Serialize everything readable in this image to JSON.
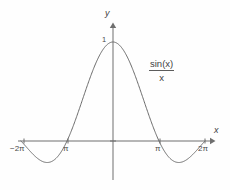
{
  "figure": {
    "title": "",
    "background_color": "#fefefe",
    "line_color": "#6a6a6a",
    "text_color": "#4a4a4a",
    "width": 230,
    "height": 190
  },
  "axes": {
    "y_axis_label": "y",
    "x_axis_label": "x",
    "y_tick_label": "1",
    "x_tick_labels": [
      "−2π",
      "π",
      "π",
      "2π"
    ],
    "x_tick_left_outer": "−2π",
    "x_tick_left_inner": "π",
    "x_tick_right_inner": "π",
    "x_tick_right_outer": "2π"
  },
  "annotation": {
    "numerator": "sin(x)",
    "denominator": "x",
    "full_text": "sin(x)/x"
  },
  "chart_data": {
    "type": "line",
    "title": "",
    "xlabel": "x",
    "ylabel": "y",
    "function": "sin(x)/x",
    "legend": [
      "sin(x)/x"
    ],
    "legend_position": "inline-right",
    "grid": false,
    "xlim": [
      -6.8,
      7.4
    ],
    "ylim": [
      -0.42,
      1.22
    ],
    "xticks": [
      -6.283185,
      -3.141593,
      3.141593,
      6.283185
    ],
    "xtick_labels": [
      "−2π",
      "π",
      "π",
      "2π"
    ],
    "yticks": [
      1
    ],
    "ytick_labels": [
      "1"
    ],
    "annotations": [
      {
        "text": "sin(x)/x",
        "x": 4.4,
        "y": 0.62
      }
    ],
    "key_points": {
      "maximum": {
        "x": 0,
        "y": 1
      },
      "zeros": [
        -6.283185,
        -3.141593,
        3.141593,
        6.283185
      ],
      "minima": [
        {
          "x": -4.493409,
          "y": -0.217234
        },
        {
          "x": 4.493409,
          "y": -0.217234
        }
      ]
    },
    "x": [
      -6.283185,
      -5.969026,
      -5.654867,
      -5.340708,
      -5.026548,
      -4.712389,
      -4.39823,
      -4.08407,
      -3.769911,
      -3.455752,
      -3.141593,
      -2.827433,
      -2.513274,
      -2.199115,
      -1.884956,
      -1.570796,
      -1.256637,
      -0.942478,
      -0.628319,
      -0.314159,
      0,
      0.314159,
      0.628319,
      0.942478,
      1.256637,
      1.570796,
      1.884956,
      2.199115,
      2.513274,
      2.827433,
      3.141593,
      3.455752,
      3.769911,
      4.08407,
      4.39823,
      4.712389,
      5.026548,
      5.340708,
      5.654867,
      5.969026,
      6.283185
    ],
    "values": [
      0,
      -0.052,
      -0.101,
      -0.145,
      -0.179,
      -0.2122,
      -0.2145,
      -0.2022,
      -0.1757,
      -0.1374,
      -0.0,
      0.0682,
      0.1459,
      0.228,
      0.309,
      0.3634,
      0.4502,
      0.535,
      0.616,
      0.691,
      1.0,
      0.9836,
      0.9355,
      0.8584,
      0.7568,
      0.6366,
      0.504,
      0.3665,
      0.2313,
      0.1055,
      0.0,
      -0.0853,
      -0.1559,
      -0.2081,
      -0.2145,
      -0.2122,
      -0.1892,
      -0.1513,
      -0.1026,
      -0.0489,
      0
    ]
  }
}
